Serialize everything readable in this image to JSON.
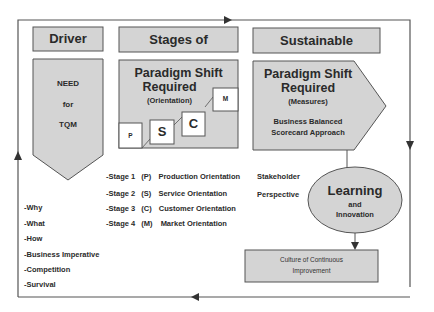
{
  "colors": {
    "box_fill": "#d4d4d4",
    "stroke": "#555555",
    "text": "#2a2a2a",
    "white": "#ffffff"
  },
  "headers": {
    "driver": "Driver",
    "stages": "Stages of",
    "sustainable": "Sustainable"
  },
  "driver_box": {
    "line1": "NEED",
    "line2": "for",
    "line3": "TQM"
  },
  "stages_box": {
    "title1": "Paradigm Shift",
    "title2": "Required",
    "subtitle": "(Orientation)",
    "steps": [
      {
        "label": "P"
      },
      {
        "label": "S"
      },
      {
        "label": "C"
      },
      {
        "label": "M"
      }
    ]
  },
  "sustainable_box": {
    "title1": "Paradigm Shift",
    "title2": "Required",
    "subtitle": "(Measures)",
    "body1": "Business Balanced",
    "body2": "Scorecard Approach"
  },
  "driver_list": [
    "-Why",
    "-What",
    "-How",
    "-Business Imperative",
    "-Competition",
    "-Survival"
  ],
  "stage_list": [
    {
      "stage": "-Stage 1",
      "code": "(P)",
      "name": "Production Orientation"
    },
    {
      "stage": "-Stage 2",
      "code": "(S)",
      "name": "Service Orientation"
    },
    {
      "stage": "-Stage 3",
      "code": "(C)",
      "name": "Customer Orientation"
    },
    {
      "stage": "-Stage 4",
      "code": "(M)",
      "name": "Market Orientation"
    }
  ],
  "stakeholder": {
    "line1": "Stakeholder",
    "line2": "Perspective"
  },
  "learning": {
    "line1": "Learning",
    "line2": "and",
    "line3": "Innovation"
  },
  "culture": {
    "line1": "Culture of Continuous",
    "line2": "Improvement"
  }
}
